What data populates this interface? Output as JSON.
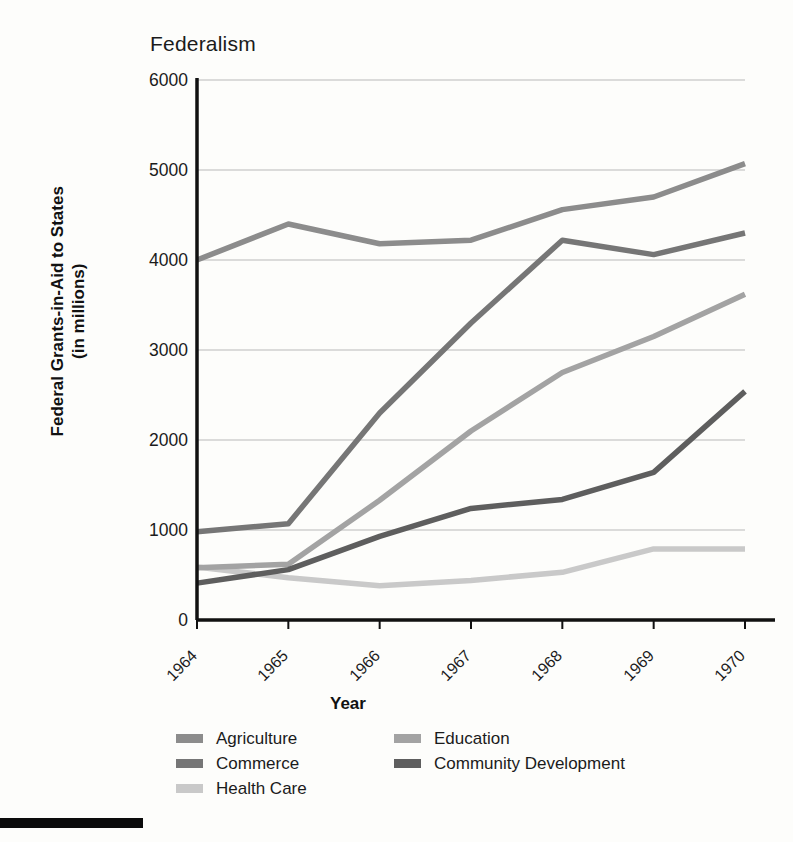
{
  "chart_data": {
    "type": "line",
    "title": "Federalism",
    "xlabel": "Year",
    "ylabel": "Federal Grants-in-Aid to States (in millions)",
    "categories": [
      "1964",
      "1965",
      "1966",
      "1967",
      "1968",
      "1969",
      "1970"
    ],
    "x": [
      1964,
      1965,
      1966,
      1967,
      1968,
      1969,
      1970
    ],
    "ylim": [
      0,
      6000
    ],
    "yticks": [
      "0",
      "1000",
      "2000",
      "3000",
      "4000",
      "5000",
      "6000"
    ],
    "ytick_values": [
      0,
      1000,
      2000,
      3000,
      4000,
      5000,
      6000
    ],
    "grid": true,
    "legend_position": "bottom",
    "series": [
      {
        "name": "Agriculture",
        "color": "#8c8c8c",
        "values": [
          4000,
          4400,
          4180,
          4220,
          4560,
          4700,
          5070
        ]
      },
      {
        "name": "Commerce",
        "color": "#767676",
        "values": [
          980,
          1070,
          2300,
          3300,
          4220,
          4060,
          4300
        ]
      },
      {
        "name": "Health Care",
        "color": "#c9c9c9",
        "values": [
          590,
          470,
          380,
          440,
          530,
          790,
          790
        ]
      },
      {
        "name": "Education",
        "color": "#a3a3a3",
        "values": [
          580,
          620,
          1330,
          2100,
          2750,
          3150,
          3620
        ]
      },
      {
        "name": "Community Development",
        "color": "#5e5e5e",
        "values": [
          410,
          560,
          930,
          1240,
          1340,
          1640,
          2540
        ]
      }
    ]
  },
  "legend": {
    "columns": [
      [
        "Agriculture",
        "Commerce",
        "Health Care"
      ],
      [
        "Education",
        "Community Development"
      ]
    ]
  }
}
